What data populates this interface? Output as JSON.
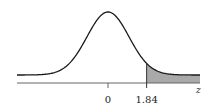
{
  "chart_data": {
    "type": "area",
    "title": "",
    "xlabel": "z",
    "ylabel": "",
    "x_ticks": [
      {
        "value": 0,
        "label": "0"
      },
      {
        "value": 1.84,
        "label": "1.84"
      }
    ],
    "xlim": [
      -3.2,
      3.2
    ],
    "grid": false,
    "legend": null,
    "curve": "standard-normal-pdf",
    "shaded_region": {
      "from": 1.84,
      "to": "infinity",
      "side": "right-tail"
    },
    "colors": {
      "curve": "#1a1a1a",
      "shade": "#a9a9a9",
      "axis": "#555555"
    }
  },
  "labels": {
    "tick_zero": "0",
    "tick_cut": "1.84",
    "axis_var": "z"
  }
}
